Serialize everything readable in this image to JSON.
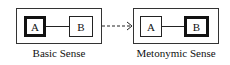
{
  "diagram": {
    "left": {
      "caption": "Basic Sense",
      "nodes": [
        {
          "label": "A",
          "emphasis": "thick"
        },
        {
          "label": "B",
          "emphasis": "thin"
        }
      ]
    },
    "right": {
      "caption": "Metonymic Sense",
      "nodes": [
        {
          "label": "A",
          "emphasis": "thin"
        },
        {
          "label": "B",
          "emphasis": "thick"
        }
      ]
    },
    "arrow": {
      "style": "dashed",
      "direction": "left-to-right"
    }
  }
}
